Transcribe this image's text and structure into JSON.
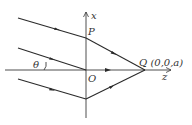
{
  "diagram": {
    "labels": {
      "x_axis": "x",
      "z_axis": "z",
      "point_p": "P",
      "point_o": "O",
      "angle": "θ",
      "point_q": "Q (0,0,a)"
    },
    "colors": {
      "line": "#2a2a2a",
      "background": "#ffffff"
    }
  }
}
